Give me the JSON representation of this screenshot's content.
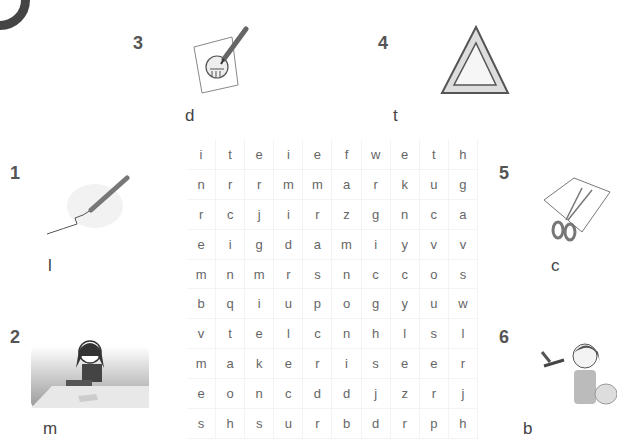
{
  "exercise": {
    "section_badge": "",
    "items": [
      {
        "number": "1",
        "icon": "pen-drawing-line-icon",
        "initial_letter": "l"
      },
      {
        "number": "2",
        "icon": "girl-making-craft-icon",
        "initial_letter": "m"
      },
      {
        "number": "3",
        "icon": "pencil-drawing-picture-icon",
        "initial_letter": "d"
      },
      {
        "number": "4",
        "icon": "triangle-icon",
        "initial_letter": "t"
      },
      {
        "number": "5",
        "icon": "scissors-cutting-paper-icon",
        "initial_letter": "c"
      },
      {
        "number": "6",
        "icon": "girl-painting-brush-icon",
        "initial_letter": "b"
      }
    ],
    "word_search": {
      "rows": [
        [
          "i",
          "t",
          "e",
          "i",
          "e",
          "f",
          "w",
          "e",
          "t",
          "h"
        ],
        [
          "n",
          "r",
          "r",
          "m",
          "m",
          "a",
          "r",
          "k",
          "u",
          "g"
        ],
        [
          "r",
          "c",
          "j",
          "i",
          "r",
          "z",
          "g",
          "n",
          "c",
          "a"
        ],
        [
          "e",
          "i",
          "g",
          "d",
          "a",
          "m",
          "i",
          "y",
          "v",
          "v"
        ],
        [
          "m",
          "n",
          "m",
          "r",
          "s",
          "n",
          "c",
          "c",
          "o",
          "s"
        ],
        [
          "b",
          "q",
          "i",
          "u",
          "p",
          "o",
          "g",
          "y",
          "u",
          "w"
        ],
        [
          "v",
          "t",
          "e",
          "l",
          "c",
          "n",
          "h",
          "l",
          "s",
          "l"
        ],
        [
          "m",
          "a",
          "k",
          "e",
          "r",
          "i",
          "s",
          "e",
          "e",
          "r"
        ],
        [
          "e",
          "o",
          "n",
          "c",
          "d",
          "d",
          "j",
          "z",
          "r",
          "j"
        ],
        [
          "s",
          "h",
          "s",
          "u",
          "r",
          "b",
          "d",
          "r",
          "p",
          "h"
        ]
      ]
    }
  }
}
